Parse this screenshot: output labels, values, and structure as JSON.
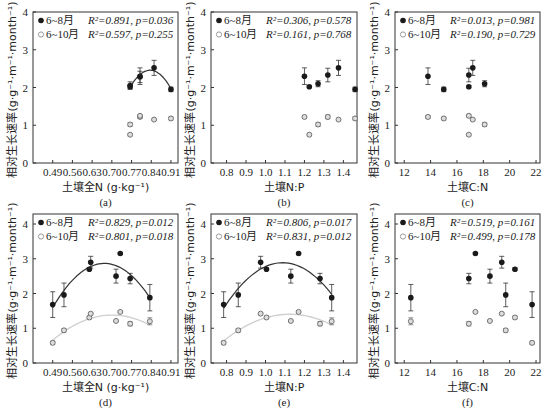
{
  "ylabel": "相对生长速率(g·g⁻¹·m⁻¹·month⁻¹)",
  "legend": {
    "series1": "6~8月",
    "series2": "6~10月"
  },
  "colors": {
    "series1": "#1a1a1a",
    "series2": "#9a9a9a",
    "fit1": "#333333",
    "fit2": "#d0d0d0"
  },
  "chart_data": [
    {
      "panel": "(a)",
      "type": "scatter",
      "xlabel": "土壤全N (g·kg⁻¹)",
      "ylabel": "相对生长速率(g·g⁻¹·m⁻¹·month⁻¹)",
      "xticks": [
        "0.49",
        "0.56",
        "0.63",
        "0.70",
        "0.77",
        "0.84",
        "0.91"
      ],
      "xlim": [
        0.42,
        0.935
      ],
      "yticks": [
        0,
        1,
        2,
        3,
        4
      ],
      "ylim": [
        0,
        4
      ],
      "stats": [
        "R²=0.891, p=0.036",
        "R²=0.597, p=0.255"
      ],
      "series": [
        {
          "name": "6~8月",
          "fit": "quadratic",
          "points": [
            [
              0.765,
              2.02,
              0.05
            ],
            [
              0.765,
              2.05,
              0.1
            ],
            [
              0.8,
              2.3,
              0.22
            ],
            [
              0.8,
              2.28,
              0.15
            ],
            [
              0.85,
              2.52,
              0.2
            ],
            [
              0.91,
              1.95,
              0.06
            ]
          ]
        },
        {
          "name": "6~10月",
          "fit": "none",
          "points": [
            [
              0.765,
              1.02,
              0.05
            ],
            [
              0.765,
              0.75,
              0.03
            ],
            [
              0.8,
              1.22,
              0.04
            ],
            [
              0.8,
              1.25,
              0.03
            ],
            [
              0.85,
              1.15,
              0.02
            ],
            [
              0.91,
              1.18,
              0.04
            ]
          ]
        }
      ]
    },
    {
      "panel": "(b)",
      "type": "scatter",
      "xlabel": "土壤N:P",
      "ylabel": "相对生长速率(g·g⁻¹·m⁻¹·month⁻¹)",
      "xticks": [
        "0.8",
        "0.9",
        "1.0",
        "1.1",
        "1.2",
        "1.3",
        "1.4"
      ],
      "xlim": [
        0.72,
        1.47
      ],
      "yticks": [
        0,
        1,
        2,
        3,
        4
      ],
      "ylim": [
        0,
        4
      ],
      "stats": [
        "R²=0.306, p=0.578",
        "R²=0.161, p=0.768"
      ],
      "series": [
        {
          "name": "6~8月",
          "fit": "none",
          "points": [
            [
              1.2,
              2.3,
              0.22
            ],
            [
              1.225,
              2.02,
              0.03
            ],
            [
              1.27,
              2.1,
              0.08
            ],
            [
              1.32,
              2.33,
              0.18
            ],
            [
              1.375,
              2.52,
              0.2
            ],
            [
              1.46,
              1.95,
              0.06
            ]
          ]
        },
        {
          "name": "6~10月",
          "fit": "none",
          "points": [
            [
              1.2,
              1.22,
              0.04
            ],
            [
              1.225,
              0.75,
              0.03
            ],
            [
              1.27,
              1.02,
              0.05
            ],
            [
              1.32,
              1.22,
              0.05
            ],
            [
              1.375,
              1.15,
              0.02
            ],
            [
              1.46,
              1.18,
              0.04
            ]
          ]
        }
      ]
    },
    {
      "panel": "(c)",
      "type": "scatter",
      "xlabel": "土壤C:N",
      "ylabel": "相对生长速率(g·g⁻¹·m⁻¹·month⁻¹)",
      "xticks": [
        "12",
        "14",
        "16",
        "18",
        "20",
        "22"
      ],
      "xlim": [
        11.3,
        22.3
      ],
      "yticks": [
        0,
        1,
        2,
        3,
        4
      ],
      "ylim": [
        0,
        4
      ],
      "stats": [
        "R²=0.013, p=0.981",
        "R²=0.190, p=0.729"
      ],
      "series": [
        {
          "name": "6~8月",
          "fit": "none",
          "points": [
            [
              13.8,
              2.3,
              0.22
            ],
            [
              15.0,
              1.95,
              0.06
            ],
            [
              16.9,
              2.02,
              0.03
            ],
            [
              16.9,
              2.33,
              0.18
            ],
            [
              17.2,
              2.52,
              0.2
            ],
            [
              18.1,
              2.1,
              0.08
            ]
          ]
        },
        {
          "name": "6~10月",
          "fit": "none",
          "points": [
            [
              13.8,
              1.22,
              0.04
            ],
            [
              15.0,
              1.18,
              0.04
            ],
            [
              16.9,
              0.75,
              0.03
            ],
            [
              16.9,
              1.25,
              0.04
            ],
            [
              17.2,
              1.15,
              0.02
            ],
            [
              18.1,
              1.02,
              0.05
            ]
          ]
        }
      ]
    },
    {
      "panel": "(d)",
      "type": "scatter",
      "xlabel": "土壤全N (g·kg⁻¹)",
      "ylabel": "相对生长速率(g·g⁻¹·m⁻¹·month⁻¹)",
      "xticks": [
        "0.49",
        "0.56",
        "0.63",
        "0.70",
        "0.77",
        "0.84",
        "0.91"
      ],
      "xlim": [
        0.42,
        0.935
      ],
      "yticks": [
        0,
        1,
        2,
        3,
        4
      ],
      "ylim": [
        0,
        4.3
      ],
      "stats": [
        "R²=0.829, p=0.012",
        "R²=0.801, p=0.018"
      ],
      "series": [
        {
          "name": "6~8月",
          "fit": "quadratic",
          "points": [
            [
              0.49,
              1.68,
              0.37
            ],
            [
              0.53,
              1.96,
              0.34
            ],
            [
              0.62,
              2.7,
              0.04
            ],
            [
              0.625,
              2.9,
              0.17
            ],
            [
              0.715,
              2.5,
              0.2
            ],
            [
              0.73,
              3.15,
              0.03
            ],
            [
              0.765,
              2.43,
              0.15
            ],
            [
              0.835,
              1.88,
              0.38
            ]
          ]
        },
        {
          "name": "6~10月",
          "fit": "quadratic",
          "points": [
            [
              0.49,
              0.58,
              0.05
            ],
            [
              0.53,
              0.94,
              0.05
            ],
            [
              0.62,
              1.31,
              0.04
            ],
            [
              0.625,
              1.42,
              0.03
            ],
            [
              0.715,
              1.21,
              0.02
            ],
            [
              0.73,
              1.47,
              0.02
            ],
            [
              0.765,
              1.13,
              0.06
            ],
            [
              0.835,
              1.2,
              0.1
            ]
          ]
        }
      ]
    },
    {
      "panel": "(e)",
      "type": "scatter",
      "xlabel": "土壤N:P",
      "ylabel": "相对生长速率(g·g⁻¹·m⁻¹·month⁻¹)",
      "xticks": [
        "0.8",
        "0.9",
        "1.0",
        "1.1",
        "1.2",
        "1.3",
        "1.4"
      ],
      "xlim": [
        0.72,
        1.47
      ],
      "yticks": [
        0,
        1,
        2,
        3,
        4
      ],
      "ylim": [
        0,
        4.3
      ],
      "stats": [
        "R²=0.806, p=0.017",
        "R²=0.831, p=0.012"
      ],
      "series": [
        {
          "name": "6~8月",
          "fit": "quadratic",
          "points": [
            [
              0.785,
              1.68,
              0.37
            ],
            [
              0.86,
              1.96,
              0.34
            ],
            [
              0.975,
              2.9,
              0.17
            ],
            [
              1.005,
              2.7,
              0.04
            ],
            [
              1.13,
              2.5,
              0.2
            ],
            [
              1.17,
              3.15,
              0.03
            ],
            [
              1.28,
              2.43,
              0.15
            ],
            [
              1.34,
              1.88,
              0.38
            ]
          ]
        },
        {
          "name": "6~10月",
          "fit": "quadratic",
          "points": [
            [
              0.785,
              0.58,
              0.05
            ],
            [
              0.86,
              0.94,
              0.05
            ],
            [
              0.975,
              1.42,
              0.03
            ],
            [
              1.005,
              1.31,
              0.04
            ],
            [
              1.13,
              1.21,
              0.02
            ],
            [
              1.17,
              1.47,
              0.02
            ],
            [
              1.28,
              1.13,
              0.06
            ],
            [
              1.34,
              1.2,
              0.1
            ]
          ]
        }
      ]
    },
    {
      "panel": "(f)",
      "type": "scatter",
      "xlabel": "土壤C:N",
      "ylabel": "相对生长速率(g·g⁻¹·m⁻¹·month⁻¹)",
      "xticks": [
        "12",
        "14",
        "16",
        "18",
        "20",
        "22"
      ],
      "xlim": [
        11.3,
        22.3
      ],
      "yticks": [
        0,
        1,
        2,
        3,
        4
      ],
      "ylim": [
        0,
        4.3
      ],
      "stats": [
        "R²=0.519, p=0.161",
        "R²=0.499, p=0.178"
      ],
      "series": [
        {
          "name": "6~8月",
          "fit": "none",
          "points": [
            [
              12.5,
              1.88,
              0.38
            ],
            [
              16.9,
              2.43,
              0.15
            ],
            [
              17.4,
              3.15,
              0.03
            ],
            [
              18.5,
              2.5,
              0.2
            ],
            [
              19.4,
              2.9,
              0.17
            ],
            [
              19.7,
              1.96,
              0.34
            ],
            [
              20.4,
              2.7,
              0.04
            ],
            [
              21.7,
              1.68,
              0.37
            ]
          ]
        },
        {
          "name": "6~10月",
          "fit": "none",
          "points": [
            [
              12.5,
              1.2,
              0.1
            ],
            [
              16.9,
              1.13,
              0.06
            ],
            [
              17.4,
              1.47,
              0.02
            ],
            [
              18.5,
              1.21,
              0.02
            ],
            [
              19.4,
              1.42,
              0.03
            ],
            [
              19.7,
              0.94,
              0.05
            ],
            [
              20.4,
              1.31,
              0.04
            ],
            [
              21.7,
              0.58,
              0.05
            ]
          ]
        }
      ]
    }
  ],
  "layout": {
    "panels": [
      {
        "x0": 33,
        "x1": 178,
        "y0": 12,
        "y1": 163,
        "yTop": 4
      },
      {
        "x0": 211,
        "x1": 357,
        "y0": 12,
        "y1": 163,
        "yTop": 4
      },
      {
        "x0": 395,
        "x1": 540,
        "y0": 12,
        "y1": 163,
        "yTop": 4
      },
      {
        "x0": 33,
        "x1": 178,
        "y0": 214,
        "y1": 363,
        "yTop": 4.3
      },
      {
        "x0": 211,
        "x1": 357,
        "y0": 214,
        "y1": 363,
        "yTop": 4.3
      },
      {
        "x0": 395,
        "x1": 540,
        "y0": 214,
        "y1": 363,
        "yTop": 4.3
      }
    ]
  }
}
